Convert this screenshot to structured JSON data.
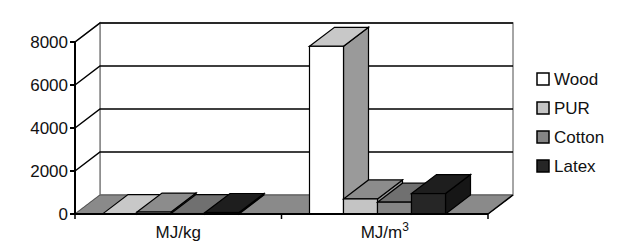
{
  "chart_data": {
    "type": "bar",
    "style": "3d-clustered-column",
    "title": "",
    "xlabel": "",
    "ylabel": "",
    "categories": [
      "MJ/kg",
      "MJ/m3"
    ],
    "category_labels": [
      {
        "text": "MJ/kg",
        "sup": ""
      },
      {
        "text": "MJ/m",
        "sup": "3"
      }
    ],
    "series": [
      {
        "name": "Wood",
        "values": [
          18,
          7800
        ],
        "color": "#ffffff",
        "side": "#9a9a9a",
        "top": "#c8c8c8"
      },
      {
        "name": "PUR",
        "values": [
          90,
          700
        ],
        "color": "#c4c4c4",
        "side": "#9a9a9a",
        "top": "#8c8c8c"
      },
      {
        "name": "Cotton",
        "values": [
          20,
          550
        ],
        "color": "#858585",
        "side": "#5c5c5c",
        "top": "#707070"
      },
      {
        "name": "Latex",
        "values": [
          70,
          950
        ],
        "color": "#262626",
        "side": "#161616",
        "top": "#1e1e1e"
      }
    ],
    "yticks": [
      "0",
      "2000",
      "4000",
      "6000",
      "8000"
    ],
    "ylim": [
      0,
      8000
    ],
    "grid": true,
    "legend_position": "right"
  }
}
